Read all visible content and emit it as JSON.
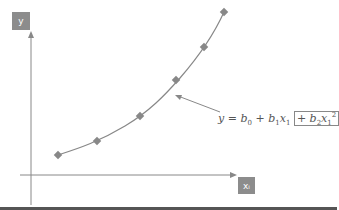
{
  "diagram": {
    "y_axis_label": "y",
    "x_axis_label": "xᵢ",
    "equation": {
      "lhs": "y",
      "terms": [
        "b0",
        "b1x1",
        "b2x1^2"
      ],
      "boxed_term": "+ b2x1^2"
    },
    "points": [
      [
        58,
        155
      ],
      [
        97,
        141
      ],
      [
        140,
        116
      ],
      [
        176,
        80
      ],
      [
        204,
        47
      ],
      [
        224,
        12
      ]
    ],
    "colors": {
      "axis": "#888888",
      "curve": "#888888",
      "marker": "#888888",
      "label_bg": "#8c8c8c"
    }
  }
}
